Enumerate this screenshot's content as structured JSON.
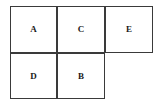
{
  "figure": {
    "type": "rectangle-grid-diagram",
    "background_color": "#ffffff",
    "stroke_color": "#3a3a3a",
    "label_color": "#1a1a1a",
    "rows": [
      {
        "name": "top-row",
        "cells": [
          {
            "label": "A"
          },
          {
            "label": "C"
          },
          {
            "label": "E"
          }
        ]
      },
      {
        "name": "bottom-row",
        "cells": [
          {
            "label": "D"
          },
          {
            "label": "B"
          }
        ]
      }
    ]
  }
}
